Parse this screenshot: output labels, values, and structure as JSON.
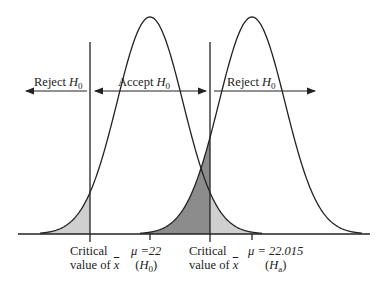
{
  "diagram": {
    "title": "",
    "curves": [
      {
        "name": "H0",
        "mean_label": "μ =22",
        "hyp_label": "H",
        "hyp_sub": "0",
        "center_x": 150,
        "sigma_px": 33
      },
      {
        "name": "Ha",
        "mean_label": "μ = 22.015",
        "hyp_label": "H",
        "hyp_sub": "a",
        "center_x": 252,
        "sigma_px": 33
      }
    ],
    "critical_lines": [
      {
        "x": 90,
        "label_line1": "Critical",
        "label_line2": "value of ",
        "xbar": "x"
      },
      {
        "x": 210,
        "label_line1": "Critical",
        "label_line2": "value of ",
        "xbar": "x"
      }
    ],
    "regions": [
      {
        "name": "reject-left",
        "label": "Reject ",
        "sym": "H",
        "sub": "0"
      },
      {
        "name": "accept",
        "label": "Accept ",
        "sym": "H",
        "sub": "0"
      },
      {
        "name": "reject-right",
        "label": "Reject ",
        "sym": "H",
        "sub": "0"
      }
    ],
    "colors": {
      "line": "#222222",
      "light_shade": "#cfcfcf",
      "dark_shade": "#8c8c8c"
    },
    "geometry": {
      "baseline_y": 234,
      "peak_y": 17,
      "axis_x0": 18,
      "axis_x1": 370,
      "arrow_y": 91
    }
  }
}
